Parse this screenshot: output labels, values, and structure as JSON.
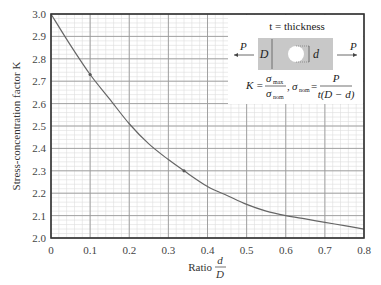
{
  "chart_data": {
    "type": "line",
    "title": "",
    "xlabel": "Ratio d/D",
    "xlabel_prefix": "Ratio",
    "xlabel_num": "d",
    "xlabel_den": "D",
    "ylabel": "Stress-concentration factor K",
    "xlim": [
      0,
      0.8
    ],
    "ylim": [
      2.0,
      3.0
    ],
    "grid": true,
    "x_major_step": 0.1,
    "y_major_step": 0.1,
    "x_minor_step": 0.02,
    "y_minor_step": 0.02,
    "x_ticks": [
      "0",
      "0.1",
      "0.2",
      "0.3",
      "0.4",
      "0.5",
      "0.6",
      "0.7",
      "0.8"
    ],
    "y_ticks": [
      "2.0",
      "2.1",
      "2.2",
      "2.3",
      "2.4",
      "2.5",
      "2.6",
      "2.7",
      "2.8",
      "2.9",
      "3.0"
    ],
    "series": [
      {
        "name": "K vs d/D",
        "x": [
          0,
          0.05,
          0.1,
          0.15,
          0.2,
          0.25,
          0.3,
          0.34,
          0.4,
          0.45,
          0.5,
          0.55,
          0.6,
          0.65,
          0.7,
          0.75,
          0.8
        ],
        "values": [
          3.0,
          2.86,
          2.73,
          2.62,
          2.51,
          2.42,
          2.35,
          2.3,
          2.23,
          2.19,
          2.15,
          2.12,
          2.1,
          2.085,
          2.07,
          2.055,
          2.04
        ]
      }
    ],
    "markers": [
      {
        "x": 0.1,
        "y": 2.73
      },
      {
        "x": 0.34,
        "y": 2.3
      }
    ],
    "inset": {
      "thickness_label": "t = thickness",
      "load_left": "P",
      "load_right": "P",
      "width_label": "D",
      "hole_label": "d",
      "formula_K": "K =",
      "sigma_max": "σ",
      "sigma_max_sub": "max",
      "sigma_nom": "σ",
      "sigma_nom_sub": "nom",
      "formula_sep": ",",
      "sigma_nom_eq": "σ",
      "sigma_nom_eq_sub": "nom",
      "equals": "=",
      "numerator_P": "P",
      "denominator": "t(D − d)"
    },
    "colors": {
      "curve": "#666666",
      "grid_major": "#9a9a9a",
      "grid_minor": "#dddddd",
      "frame": "#333333",
      "plate": "#c8c8c8"
    }
  }
}
